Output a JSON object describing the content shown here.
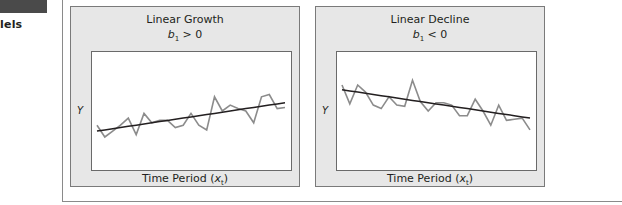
{
  "side": {
    "partial_heading": "lels"
  },
  "chart_data": [
    {
      "type": "line",
      "title": "Linear Growth",
      "subtitle_var": "b",
      "subtitle_sub": "1",
      "subtitle_rel": " > 0",
      "xlabel_text": "Time Period (",
      "xlabel_var": "x",
      "xlabel_sub": "t",
      "xlabel_close": ")",
      "ylabel": "Y",
      "x": [
        0,
        1,
        2,
        3,
        4,
        5,
        6,
        7,
        8,
        9,
        10,
        11,
        12,
        13,
        14,
        15,
        16,
        17,
        18,
        19,
        20,
        21,
        22,
        23,
        24
      ],
      "series": [
        {
          "name": "observed",
          "values": [
            38,
            28,
            33,
            38,
            44,
            30,
            48,
            40,
            42,
            42,
            36,
            38,
            48,
            38,
            34,
            62,
            50,
            55,
            52,
            50,
            40,
            62,
            64,
            52,
            53
          ]
        },
        {
          "name": "trend",
          "values": [
            33,
            34,
            35,
            36,
            37,
            38,
            39,
            40,
            41,
            42,
            43,
            44,
            45,
            46,
            47,
            48,
            49,
            50,
            51,
            52,
            53,
            54,
            55,
            56,
            57
          ]
        }
      ],
      "xlim": [
        0,
        24
      ],
      "ylim": [
        0,
        100
      ],
      "grid": false
    },
    {
      "type": "line",
      "title": "Linear Decline",
      "subtitle_var": "b",
      "subtitle_sub": "1",
      "subtitle_rel": " < 0",
      "xlabel_text": "Time Period (",
      "xlabel_var": "x",
      "xlabel_sub": "t",
      "xlabel_close": ")",
      "ylabel": "Y",
      "x": [
        0,
        1,
        2,
        3,
        4,
        5,
        6,
        7,
        8,
        9,
        10,
        11,
        12,
        13,
        14,
        15,
        16,
        17,
        18,
        19,
        20,
        21,
        22,
        23,
        24
      ],
      "series": [
        {
          "name": "observed",
          "values": [
            72,
            56,
            72,
            66,
            55,
            52,
            62,
            55,
            54,
            76,
            58,
            50,
            57,
            57,
            55,
            46,
            46,
            60,
            50,
            38,
            55,
            42,
            43,
            44,
            34
          ]
        },
        {
          "name": "trend",
          "values": [
            68,
            67,
            66,
            65,
            64,
            63,
            62,
            61,
            60,
            59,
            58,
            57,
            56,
            55,
            54,
            53,
            52,
            51,
            50,
            49,
            48,
            47,
            46,
            45,
            44
          ]
        }
      ],
      "xlim": [
        0,
        24
      ],
      "ylim": [
        0,
        100
      ],
      "grid": false
    }
  ]
}
